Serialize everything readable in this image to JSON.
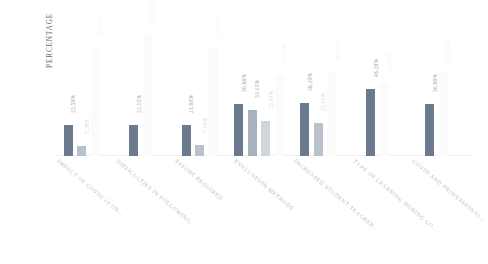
{
  "chart_data": {
    "type": "bar",
    "title": "",
    "subtitle": "",
    "xlabel": "",
    "ylabel": "PERCENTAGE",
    "ylim": [
      0,
      100
    ],
    "grid": false,
    "legend_position": "none",
    "value_suffix": "%",
    "categories": [
      "IMPACT OF COVID 19 ON...",
      "DIFFICULTIES IN FOLLOWING...",
      "EFFORT REQUIRED",
      "EVALUATION METHODS",
      "INCREASED STUDENT TEACHER...",
      "TYPE OF LEARNING DURING CO...",
      "COVID AND PROFESSIONAL..."
    ],
    "groups": [
      {
        "category": "IMPACT OF COVID 19 ON...",
        "bars": [
          {
            "label": "22.50%",
            "value": 22.5,
            "color": "#6b7a8f"
          },
          {
            "label": "7.20%",
            "value": 7.2,
            "color": "#b9c2cc"
          },
          {
            "label": "76.88%",
            "value": 76.88,
            "color": "#fbfbfb"
          }
        ]
      },
      {
        "category": "DIFFICULTIES IN FOLLOWING...",
        "bars": [
          {
            "label": "22.15%",
            "value": 22.15,
            "color": "#6b7a8f"
          },
          {
            "label": "87.24%",
            "value": 87.24,
            "color": "#fbfbfb"
          }
        ]
      },
      {
        "category": "EFFORT REQUIRED",
        "bars": [
          {
            "label": "21.80%",
            "value": 21.8,
            "color": "#6b7a8f"
          },
          {
            "label": "7.70%",
            "value": 7.7,
            "color": "#b9c2cc"
          },
          {
            "label": "77.06%",
            "value": 77.06,
            "color": "#fbfbfb"
          }
        ]
      },
      {
        "category": "EVALUATION METHODS",
        "bars": [
          {
            "label": "36.88%",
            "value": 36.88,
            "color": "#6b7a8f"
          },
          {
            "label": "33.15%",
            "value": 33.15,
            "color": "#a8b2bd"
          },
          {
            "label": "25.10%",
            "value": 25.1,
            "color": "#cfd5db"
          },
          {
            "label": "57.80%",
            "value": 57.8,
            "color": "#fbfbfb"
          }
        ]
      },
      {
        "category": "INCREASED STUDENT TEACHER...",
        "bars": [
          {
            "label": "38.20%",
            "value": 38.2,
            "color": "#6b7a8f"
          },
          {
            "label": "23.45%",
            "value": 23.45,
            "color": "#b9c2cc"
          },
          {
            "label": "60.20%",
            "value": 60.2,
            "color": "#fbfbfb"
          }
        ]
      },
      {
        "category": "TYPE OF LEARNING DURING CO...",
        "bars": [
          {
            "label": "48.20%",
            "value": 48.2,
            "color": "#6b7a8f"
          },
          {
            "label": "52.08%",
            "value": 52.08,
            "color": "#fbfbfb"
          }
        ]
      },
      {
        "category": "COVID AND PROFESSIONAL...",
        "bars": [
          {
            "label": "36.80%",
            "value": 36.8,
            "color": "#6b7a8f"
          },
          {
            "label": "60.25%",
            "value": 60.25,
            "color": "#fbfbfb"
          }
        ]
      }
    ]
  }
}
